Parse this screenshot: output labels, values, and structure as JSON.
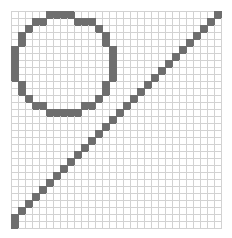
{
  "figure": {
    "type": "pixel-grid",
    "width_px": 232,
    "height_px": 238,
    "background_color": "#ffffff"
  },
  "grid": {
    "columns": 30,
    "rows": 31,
    "cell_size_px": 7,
    "origin_x_px": 11,
    "origin_y_px": 11,
    "gridline_color": "#d2d2d2",
    "gridline_width_px": 1,
    "fill_color": "#6e6e6e",
    "empty_color": "#ffffff"
  },
  "shapes": [
    {
      "name": "circle",
      "kind": "circle",
      "center_col": 7.5,
      "center_row": 7.5,
      "radius_cells": 6.5,
      "fill_color": "#6e6e6e"
    },
    {
      "name": "diagonal-line",
      "kind": "line",
      "from_col": 0,
      "from_row": 30,
      "to_col": 29,
      "to_row": 1,
      "fill_color": "#6e6e6e"
    }
  ],
  "filled_cells": [
    [
      5,
      0
    ],
    [
      6,
      0
    ],
    [
      7,
      0
    ],
    [
      8,
      0
    ],
    [
      29,
      0
    ],
    [
      3,
      1
    ],
    [
      4,
      1
    ],
    [
      9,
      1
    ],
    [
      10,
      1
    ],
    [
      11,
      1
    ],
    [
      28,
      1
    ],
    [
      2,
      2
    ],
    [
      12,
      2
    ],
    [
      27,
      2
    ],
    [
      1,
      3
    ],
    [
      13,
      3
    ],
    [
      26,
      3
    ],
    [
      1,
      4
    ],
    [
      13,
      4
    ],
    [
      25,
      4
    ],
    [
      0,
      5
    ],
    [
      14,
      5
    ],
    [
      24,
      5
    ],
    [
      0,
      6
    ],
    [
      14,
      6
    ],
    [
      23,
      6
    ],
    [
      0,
      7
    ],
    [
      14,
      7
    ],
    [
      22,
      7
    ],
    [
      0,
      8
    ],
    [
      14,
      8
    ],
    [
      21,
      8
    ],
    [
      0,
      9
    ],
    [
      14,
      9
    ],
    [
      20,
      9
    ],
    [
      1,
      10
    ],
    [
      13,
      10
    ],
    [
      19,
      10
    ],
    [
      1,
      11
    ],
    [
      13,
      11
    ],
    [
      18,
      11
    ],
    [
      2,
      12
    ],
    [
      12,
      12
    ],
    [
      17,
      12
    ],
    [
      3,
      13
    ],
    [
      4,
      13
    ],
    [
      10,
      13
    ],
    [
      11,
      13
    ],
    [
      16,
      13
    ],
    [
      5,
      14
    ],
    [
      6,
      14
    ],
    [
      7,
      14
    ],
    [
      8,
      14
    ],
    [
      9,
      14
    ],
    [
      15,
      14
    ],
    [
      14,
      15
    ],
    [
      13,
      16
    ],
    [
      12,
      17
    ],
    [
      11,
      18
    ],
    [
      10,
      19
    ],
    [
      9,
      20
    ],
    [
      8,
      21
    ],
    [
      7,
      22
    ],
    [
      6,
      23
    ],
    [
      5,
      24
    ],
    [
      4,
      25
    ],
    [
      3,
      26
    ],
    [
      2,
      27
    ],
    [
      1,
      28
    ],
    [
      0,
      29
    ],
    [
      0,
      30
    ]
  ]
}
